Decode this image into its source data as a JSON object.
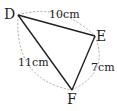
{
  "diagram": {
    "vertices": [
      {
        "name": "D",
        "x": 18,
        "y": 15
      },
      {
        "name": "E",
        "x": 95,
        "y": 36
      },
      {
        "name": "F",
        "x": 72,
        "y": 90
      }
    ],
    "sides": [
      {
        "from": "D",
        "to": "E",
        "label": "10cm",
        "length": 10,
        "unit": "cm"
      },
      {
        "from": "E",
        "to": "F",
        "label": "7cm",
        "length": 7,
        "unit": "cm"
      },
      {
        "from": "D",
        "to": "F",
        "label": "11cm",
        "length": 11,
        "unit": "cm"
      }
    ],
    "construction_arcs": "dashed",
    "colors": {
      "line": "#222222",
      "arc": "#9a9a9a",
      "text": "#222222",
      "background": "#ffffff"
    }
  }
}
